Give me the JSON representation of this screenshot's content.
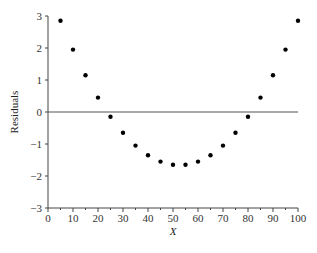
{
  "chart_data": {
    "type": "scatter",
    "title": "",
    "xlabel": "X",
    "ylabel": "Residuals",
    "xlim": [
      0,
      100
    ],
    "ylim": [
      -3,
      3
    ],
    "xticks": [
      0,
      10,
      20,
      30,
      40,
      50,
      60,
      70,
      80,
      90,
      100
    ],
    "xtick_labels": [
      "0",
      "10",
      "20",
      "30",
      "40",
      "50",
      "60",
      "70",
      "80",
      "90",
      "100"
    ],
    "xminor_step": 5,
    "yticks": [
      -3,
      -2,
      -1,
      0,
      1,
      2,
      3
    ],
    "ytick_labels": [
      "−3",
      "−2",
      "−1",
      "0",
      "1",
      "2",
      "3"
    ],
    "reference_line_y": 0,
    "grid": false,
    "legend": "none",
    "x": [
      5,
      10,
      15,
      20,
      25,
      30,
      35,
      40,
      45,
      50,
      55,
      60,
      65,
      70,
      75,
      80,
      85,
      90,
      95,
      100
    ],
    "y": [
      2.85,
      1.95,
      1.15,
      0.45,
      -0.15,
      -0.65,
      -1.05,
      -1.35,
      -1.55,
      -1.65,
      -1.65,
      -1.55,
      -1.35,
      -1.05,
      -0.65,
      -0.15,
      0.45,
      1.15,
      1.95,
      2.85
    ],
    "marker_color": "#000000",
    "axis_color": "#444444"
  }
}
